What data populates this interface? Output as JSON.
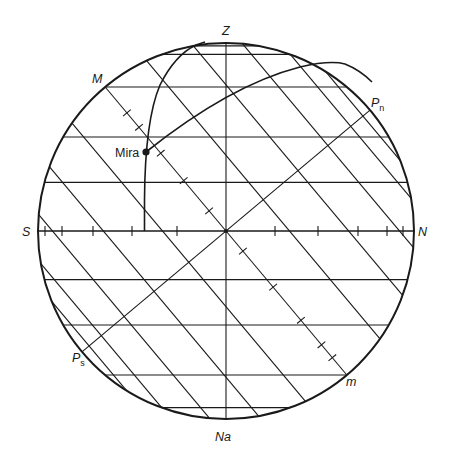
{
  "diagram": {
    "labels": {
      "zenith": "Z",
      "nadir": "Na",
      "south": "S",
      "north": "N",
      "meridian_upper": "M",
      "meridian_lower": "m",
      "north_pole": "P",
      "north_pole_sub": "n",
      "south_pole": "P",
      "south_pole_sub": "s",
      "star": "Mira"
    },
    "latitude_deg": 40,
    "almucantar_altitudes_deg": [
      -70,
      -50,
      -30,
      -15,
      15,
      30,
      50,
      70,
      80
    ],
    "declination_parallels_deg": [
      -60,
      -45,
      -30,
      -15,
      15,
      30,
      45,
      60
    ],
    "horizon_ticks_count": {
      "left": 5,
      "right": 5
    },
    "equator_ticks_count": {
      "upper": 5,
      "lower": 5
    },
    "star_position": {
      "name": "Mira",
      "hour_circle": true,
      "vertical_circle": true
    },
    "colors": {
      "ink": "#1a1a1a",
      "background": "#ffffff"
    }
  }
}
